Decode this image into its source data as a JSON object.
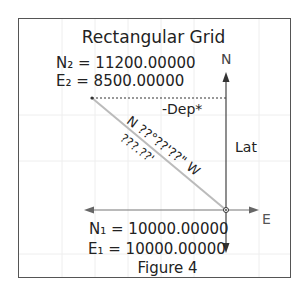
{
  "diagram": {
    "title": "Rectangular Grid",
    "point2": {
      "northing_label": "N₂ = 11200.00000",
      "easting_label": "E₂ = 8500.00000"
    },
    "point1": {
      "northing_label": "N₁ = 10000.00000",
      "easting_label": "E₁ = 10000.00000"
    },
    "axis_labels": {
      "north": "N",
      "east": "E"
    },
    "departure_label": "-Dep*",
    "latitude_label": "Lat",
    "bearing_label": "N ??°??'??\" W",
    "distance_label": "???.??'",
    "caption": "Figure 4",
    "colors": {
      "frame": "#555555",
      "axes": "#444444",
      "line": "#bbbbbb",
      "grid": "#eeeeee"
    }
  }
}
